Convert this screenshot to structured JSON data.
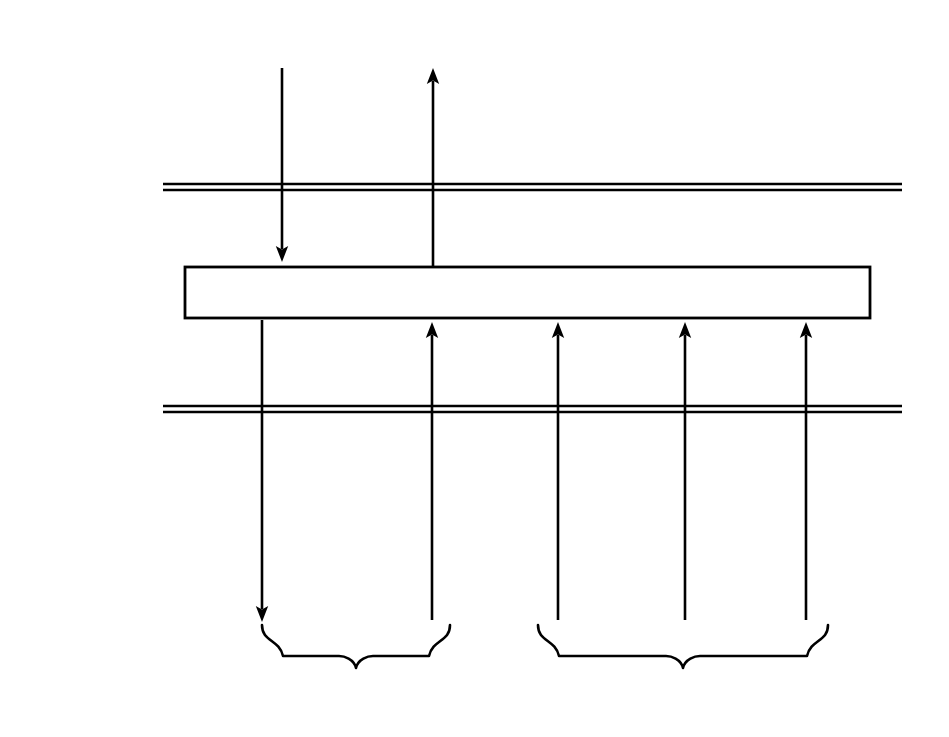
{
  "diagram": {
    "background_color": "#ffffff",
    "line_color": "#000000",
    "text_color": "#111111"
  },
  "layer_labels": [
    {
      "id": "mac-client",
      "text": "MAC Client",
      "x": 78,
      "y": 28
    },
    {
      "id": "mac",
      "text": "MAC",
      "x": 78,
      "y": 210
    },
    {
      "id": "physical-sublayer-reconciliation-unit",
      "lines": [
        "Physical",
        "Sublayer",
        "Reconciliation",
        "Unit"
      ],
      "x": 78,
      "y": 508
    }
  ],
  "boxes": [
    {
      "id": "media-access-control",
      "label": "Media Access Control",
      "x": 185,
      "y": 267,
      "width": 685,
      "height": 51,
      "label_cx": 527,
      "label_cy": 284
    }
  ],
  "dividers": [
    {
      "id": "mac-client-mac-boundary",
      "x1": 163,
      "x2": 902,
      "y_top": 184,
      "y_bottom": 190
    },
    {
      "id": "mac-physical-boundary",
      "x1": 163,
      "x2": 902,
      "y_top": 406,
      "y_bottom": 412
    }
  ],
  "signals": [
    {
      "id": "ma-unitdata-request",
      "name_line": "MA_UNITDATA.request",
      "params_line": "(DA, SA, m_sdu)",
      "direction": "down",
      "x": 282,
      "y_start": 68,
      "y_end": 262,
      "label_cx": 282,
      "label_cy": 113
    },
    {
      "id": "ma-unitdata-indication",
      "name_line": "MA_UNITDATA.indication",
      "params_line": "(DA, SA, m_sdu, reception_status)",
      "direction": "up",
      "x": 433,
      "y_start": 267,
      "y_end": 68,
      "label_cx": 458,
      "label_cy": 200
    },
    {
      "id": "pls-data-request",
      "name_line": "PLS_DATA.request",
      "params_line": "(OUTPUT_UNIT)",
      "direction": "down",
      "x": 262,
      "y_start": 320,
      "y_end": 622,
      "label_cx": 262,
      "label_cy": 343,
      "label_align": "left",
      "label_x": 196
    },
    {
      "id": "pls-data-indicate",
      "name_line": "PLS_DATA.indicate",
      "params_line": "(INPUT_UNIT)",
      "direction": "up",
      "x": 432,
      "y_start": 620,
      "y_end": 322,
      "label_cx": 432,
      "label_cy": 535
    },
    {
      "id": "pls-data-valid-indicate",
      "name_line": "PLS_DATA_VALID.indicate",
      "params_line": "(DATA_VALID_STATUS)",
      "direction": "up",
      "x": 558,
      "y_start": 620,
      "y_end": 322,
      "label_cx": 558,
      "label_cy": 445
    },
    {
      "id": "pls-carrier-indicate",
      "name_line": "PLS_CARRIER.indicate",
      "params_line": "(CARRIER_STATUS)",
      "direction": "up",
      "x": 685,
      "y_start": 620,
      "y_end": 322,
      "label_cx": 685,
      "label_cy": 535
    },
    {
      "id": "pls-signal-indicate",
      "name_line": "PLS_SIGNAL.indicate",
      "params_line": "(SIGNAL_STATUS)",
      "direction": "up",
      "x": 806,
      "y_start": 620,
      "y_end": 322,
      "label_cx": 806,
      "label_cy": 445
    }
  ],
  "braces": [
    {
      "id": "data-brace",
      "label": "Data",
      "x1": 262,
      "x2": 450,
      "y_top": 625,
      "y_depth": 668,
      "label_cx": 356,
      "label_cy": 678
    },
    {
      "id": "control-brace",
      "label": "Control",
      "x1": 538,
      "x2": 828,
      "y_top": 625,
      "y_depth": 668,
      "label_cx": 683,
      "label_cy": 678
    }
  ]
}
